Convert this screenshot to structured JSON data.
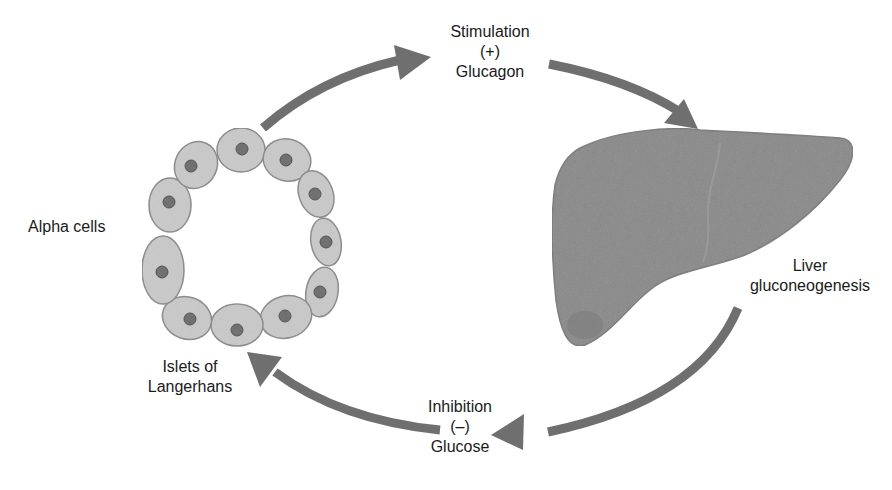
{
  "diagram": {
    "colors": {
      "arrow": "#6f6f6f",
      "cell_fill": "#c9c9c9",
      "cell_stroke": "#8a8a8a",
      "nucleus_fill": "#6a6a6a",
      "nucleus_stroke": "#4a4a4a",
      "liver_fill": "#8a8a8a",
      "liver_stroke": "#7a7a7a",
      "text": "#1a1a1a"
    },
    "labels": {
      "stimulation": [
        "Stimulation",
        "(+)",
        "Glucagon"
      ],
      "liver": [
        "Liver",
        "gluconeogenesis"
      ],
      "inhibition": [
        "Inhibition",
        "(–)",
        "Glucose"
      ],
      "alpha_cells": "Alpha cells",
      "islets": [
        "Islets of",
        "Langerhans"
      ]
    },
    "nodes": [
      {
        "id": "islets",
        "name": "Islets of Langerhans (alpha cells)"
      },
      {
        "id": "liver",
        "name": "Liver gluconeogenesis"
      }
    ],
    "edges": [
      {
        "from": "islets",
        "to": "liver",
        "label": "Stimulation (+) Glucagon"
      },
      {
        "from": "liver",
        "to": "islets",
        "label": "Inhibition (–) Glucose"
      }
    ]
  }
}
